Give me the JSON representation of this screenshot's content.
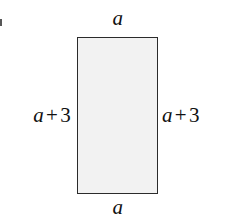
{
  "figure": {
    "kind": "geometry-diagram",
    "background_color": "#ffffff",
    "shape": {
      "type": "rectangle",
      "fill_color": "#f2f2f2",
      "stroke_color": "#2b2b2b",
      "stroke_width_px": 1.5,
      "x": 77,
      "y": 37,
      "width": 81,
      "height": 157
    },
    "labels": {
      "top": {
        "text": "a",
        "variable": "a",
        "operator": "",
        "number": ""
      },
      "bottom": {
        "text": "a",
        "variable": "a",
        "operator": "",
        "number": ""
      },
      "left": {
        "text": "a + 3",
        "variable": "a",
        "operator": "+",
        "number": "3"
      },
      "right": {
        "text": "a + 3",
        "variable": "a",
        "operator": "+",
        "number": "3"
      }
    }
  }
}
